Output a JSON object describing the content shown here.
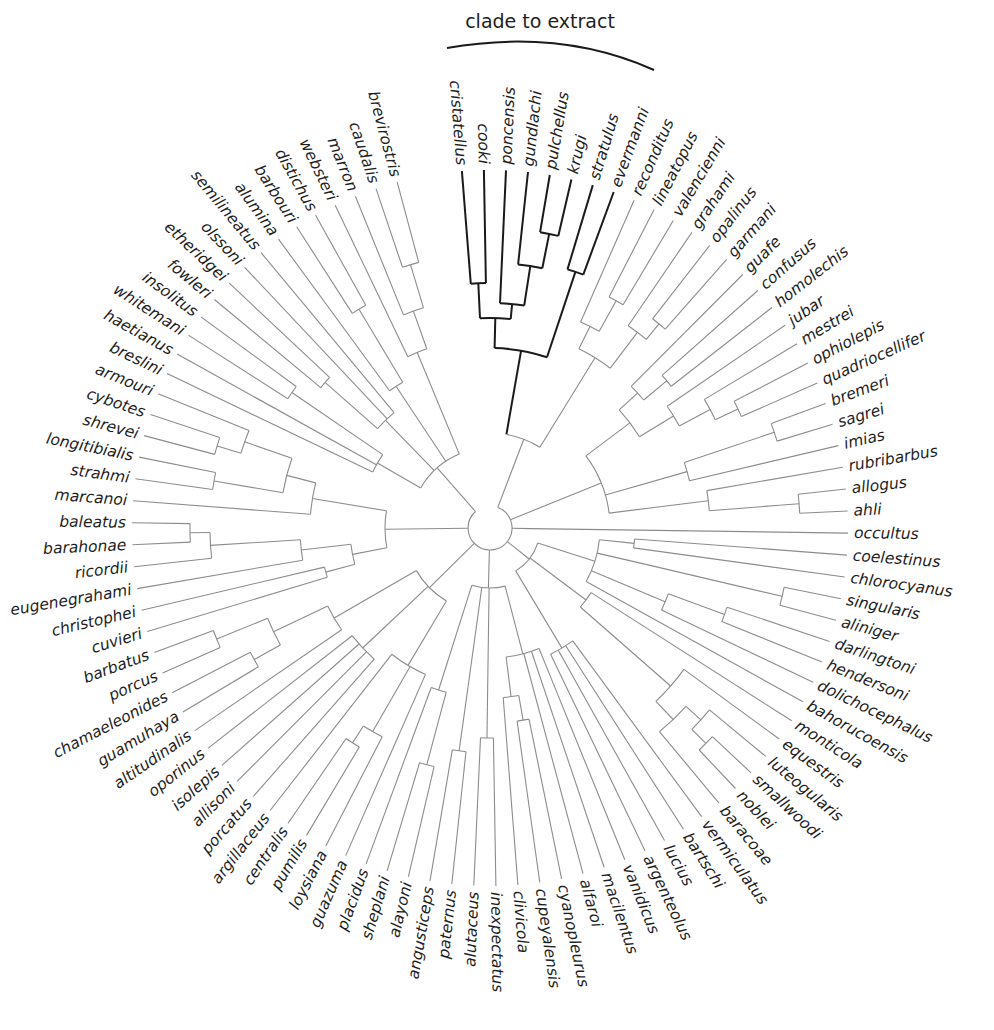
{
  "figure": {
    "type": "circular phylogenetic tree",
    "annotation": "clade to extract",
    "highlight_color": "#1a1a1a",
    "branch_color": "#8c8c8c"
  },
  "layout": {
    "center": [
      490,
      528
    ],
    "tip_radius": 358,
    "start_angle_deg": -94.5,
    "step_deg": 3.53,
    "label_gap": 6
  },
  "tips": [
    "cristatellus",
    "cooki",
    "poncensis",
    "gundlachi",
    "pulchellus",
    "krugi",
    "stratulus",
    "evermanni",
    "reconditus",
    "lineatopus",
    "valencienni",
    "grahami",
    "opalinus",
    "garmani",
    "guafe",
    "confusus",
    "homolechis",
    "jubar",
    "mestrei",
    "ophiolepis",
    "quadriocellifer",
    "bremeri",
    "sagrei",
    "imias",
    "rubribarbus",
    "allogus",
    "ahli",
    "occultus",
    "coelestinus",
    "chlorocyanus",
    "singularis",
    "aliniger",
    "darlingtoni",
    "hendersoni",
    "dolichocephalus",
    "bahorucoensis",
    "monticola",
    "equestris",
    "luteogularis",
    "smallwoodi",
    "noblei",
    "baracoae",
    "vermiculatus",
    "bartschi",
    "lucius",
    "argenteolus",
    "vanidicus",
    "macilentus",
    "alfaroi",
    "cyanopleurus",
    "cupeyalensis",
    "clivicola",
    "inexpectatus",
    "alutaceus",
    "paternus",
    "angusticeps",
    "alayoni",
    "sheplani",
    "placidus",
    "guazuma",
    "loysiana",
    "pumilis",
    "centralis",
    "argillaceus",
    "porcatus",
    "allisoni",
    "isolepis",
    "oporinus",
    "altitudinalis",
    "guamuhaya",
    "chamaeleonides",
    "porcus",
    "barbatus",
    "cuvieri",
    "christophei",
    "eugenegrahami",
    "ricordii",
    "barahonae",
    "baleatus",
    "marcanoi",
    "strahmi",
    "longitibialis",
    "shrevei",
    "cybotes",
    "armouri",
    "breslini",
    "haetianus",
    "whitemani",
    "insolitus",
    "fowleri",
    "etheridgei",
    "olssoni",
    "semilineatus",
    "alumina",
    "barbouri",
    "distichus",
    "websteri",
    "marron",
    "caudalis",
    "brevirostris"
  ],
  "highlighted_clade": [
    "cristatellus",
    "cooki",
    "poncensis",
    "gundlachi",
    "pulchellus",
    "krugi",
    "stratulus",
    "evermanni"
  ],
  "tree": {
    "r": 22,
    "c": [
      {
        "r": 95,
        "c": [
          {
            "r": 180,
            "hl": true,
            "c": [
              {
                "r": 210,
                "hl": true,
                "c": [
                  {
                    "r": 245,
                    "hl": true,
                    "c": [
                      0,
                      1
                    ]
                  },
                  {
                    "r": 225,
                    "hl": true,
                    "c": [
                      2,
                      {
                        "r": 265,
                        "hl": true,
                        "c": [
                          3,
                          {
                            "r": 300,
                            "hl": true,
                            "c": [
                              4,
                              5
                            ]
                          }
                        ]
                      }
                    ]
                  }
                ]
              },
              {
                "r": 270,
                "hl": true,
                "c": [
                  6,
                  7
                ]
              }
            ]
          },
          {
            "r": 200,
            "c": [
              {
                "r": 225,
                "c": [
                  8,
                  {
                    "r": 260,
                    "c": [
                      9,
                      10
                    ]
                  }
                ]
              },
              {
                "r": 245,
                "c": [
                  11,
                  {
                    "r": 265,
                    "c": [
                      12,
                      13
                    ]
                  }
                ]
              }
            ]
          }
        ]
      },
      {
        "r": 120,
        "c": [
          {
            "r": 175,
            "c": [
              {
                "r": 200,
                "c": [
                  14,
                  {
                    "r": 230,
                    "c": [
                      15,
                      16
                    ]
                  }
                ]
              },
              {
                "r": 215,
                "c": [
                  17,
                  {
                    "r": 250,
                    "c": [
                      18,
                      {
                        "r": 275,
                        "c": [
                          19,
                          20
                        ]
                      }
                    ]
                  }
                ]
              }
            ]
          },
          {
            "r": 205,
            "c": [
              {
                "r": 300,
                "c": [
                  21,
                  22
                ]
              },
              23
            ]
          },
          {
            "r": 220,
            "c": [
              24,
              {
                "r": 290,
                "c": [
                  {
                    "r": 310,
                    "c": [
                      25,
                      26
                    ]
                  }
                ]
              }
            ]
          }
        ]
      },
      {
        "r": 40,
        "c": [
          27
        ]
      },
      {
        "r": 50,
        "c": [
          {
            "r": 110,
            "c": [
              {
                "r": 145,
                "c": [
                  28,
                  29
                ]
              },
              {
                "r": 160,
                "c": [
                  {
                    "r": 300,
                    "c": [
                      30,
                      31
                    ]
                  }
                ]
              },
              {
                "r": 190,
                "c": [
                  {
                    "r": 250,
                    "c": [
                      32,
                      33
                    ]
                  },
                  34
                ]
              },
              35
            ]
          },
          {
            "r": 120,
            "c": [
              36,
              {
                "r": 240,
                "c": [
                  37,
                  {
                    "r": 265,
                    "c": [
                      {
                        "r": 285,
                        "c": [
                          38,
                          {
                            "r": 305,
                            "c": [
                              39,
                              40
                            ]
                          }
                        ]
                      },
                      41
                    ]
                  }
                ]
              }
            ]
          },
          {
            "r": 140,
            "c": [
              42,
              43,
              44,
              45
            ]
          }
        ]
      },
      {
        "r": 60,
        "c": [
          {
            "r": 130,
            "c": [
              46,
              47,
              48,
              {
                "r": 170,
                "c": [
                  {
                    "r": 195,
                    "c": [
                      49,
                      50
                    ]
                  },
                  51
                ]
              }
            ]
          },
          {
            "r": 150,
            "c": [
              {
                "r": 210,
                "c": [
                  52,
                  53
                ]
              }
            ]
          },
          {
            "r": 160,
            "c": [
              {
                "r": 225,
                "c": [
                  54,
                  55
                ]
              }
            ]
          },
          {
            "r": 170,
            "c": [
              {
                "r": 245,
                "c": [
                  56,
                  57
                ]
              },
              58
            ]
          }
        ]
      },
      {
        "r": 85,
        "c": [
          {
            "r": 160,
            "c": [
              59,
              {
                "r": 235,
                "c": [
                  60,
                  {
                    "r": 255,
                    "c": [
                      61,
                      62
                    ]
                  }
                ]
              },
              63
            ]
          },
          {
            "r": 175,
            "c": [
              64,
              65,
              66,
              67
            ]
          },
          {
            "r": 180,
            "c": [
              68,
              {
                "r": 240,
                "c": [
                  {
                    "r": 270,
                    "c": [
                      69,
                      70
                    ]
                  },
                  {
                    "r": 295,
                    "c": [
                      71,
                      72
                    ]
                  }
                ]
              }
            ]
          }
        ]
      },
      {
        "r": 105,
        "c": [
          {
            "r": 140,
            "c": [
              {
                "r": 170,
                "c": [
                  73,
                  74
                ]
              },
              {
                "r": 190,
                "c": [
                  75,
                  {
                    "r": 280,
                    "c": [
                      76,
                      {
                        "r": 300,
                        "c": [
                          77,
                          78
                        ]
                      }
                    ]
                  }
                ]
              }
            ]
          },
          {
            "r": 180,
            "c": [
              79,
              {
                "r": 210,
                "c": [
                  {
                    "r": 280,
                    "c": [
                      80,
                      81
                    ]
                  },
                  {
                    "r": 260,
                    "c": [
                      {
                        "r": 285,
                        "c": [
                          82,
                          83
                        ]
                      },
                      84
                    ]
                  }
                ]
              }
            ]
          }
        ]
      },
      {
        "r": 80,
        "c": [
          {
            "r": 130,
            "c": [
              85,
              86,
              {
                "r": 240,
                "c": [
                  87,
                  88
                ]
              }
            ]
          },
          {
            "r": 150,
            "c": [
              {
                "r": 220,
                "c": [
                  89,
                  90
                ]
              },
              91,
              92
            ]
          },
          {
            "r": 170,
            "c": [
              93,
              {
                "r": 255,
                "c": [
                  94,
                  95
                ]
              }
            ]
          },
          {
            "r": 190,
            "c": [
              96,
              {
                "r": 230,
                "c": [
                  97,
                  {
                    "r": 275,
                    "c": [
                      98,
                      99
                    ]
                  }
                ]
              }
            ]
          }
        ]
      }
    ]
  }
}
